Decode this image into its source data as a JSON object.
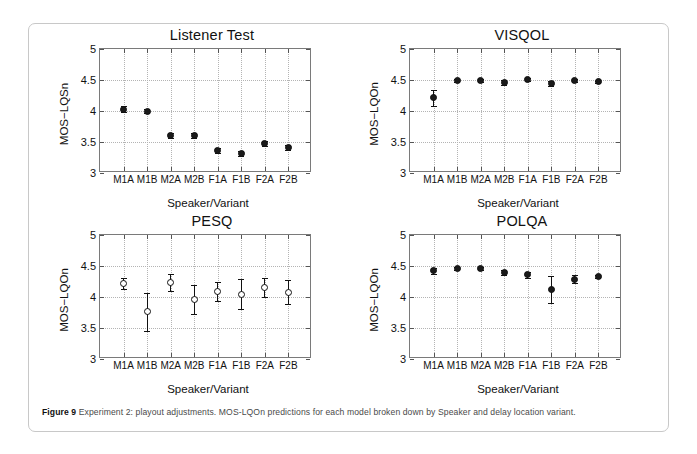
{
  "figure": {
    "caption_label": "Figure 9",
    "caption_text": "Experiment 2: playout adjustments. MOS-LQOn predictions for each model broken down by Speaker and delay location variant."
  },
  "chart_data": [
    {
      "type": "scatter",
      "title": "Listener Test",
      "xlabel": "Speaker/Variant",
      "ylabel": "MOS−LQSn",
      "categories": [
        "M1A",
        "M1B",
        "M2A",
        "M2B",
        "F1A",
        "F1B",
        "F2A",
        "F2B"
      ],
      "values": [
        4.03,
        4.0,
        3.61,
        3.61,
        3.36,
        3.32,
        3.48,
        3.41
      ],
      "err_low": [
        3.98,
        3.96,
        3.57,
        3.57,
        3.32,
        3.28,
        3.44,
        3.37
      ],
      "err_high": [
        4.08,
        4.04,
        3.65,
        3.65,
        3.4,
        3.36,
        3.52,
        3.45
      ],
      "marker_style": "filled",
      "ylim": [
        3,
        5
      ],
      "yticks": [
        "3",
        "3.5",
        "4",
        "4.5",
        "5"
      ],
      "ytick_values": [
        3,
        3.5,
        4,
        4.5,
        5
      ],
      "grid": true,
      "legend": "none"
    },
    {
      "type": "scatter",
      "title": "VISQOL",
      "xlabel": "Speaker/Variant",
      "ylabel": "MOS−LQOn",
      "categories": [
        "M1A",
        "M1B",
        "M2A",
        "M2B",
        "F1A",
        "F1B",
        "F2A",
        "F2B"
      ],
      "values": [
        4.21,
        4.49,
        4.49,
        4.46,
        4.51,
        4.45,
        4.49,
        4.47
      ],
      "err_low": [
        4.08,
        4.46,
        4.46,
        4.42,
        4.49,
        4.41,
        4.46,
        4.45
      ],
      "err_high": [
        4.34,
        4.52,
        4.52,
        4.5,
        4.53,
        4.49,
        4.52,
        4.49
      ],
      "marker_style": "filled",
      "ylim": [
        3,
        5
      ],
      "yticks": [
        "3",
        "3.5",
        "4",
        "4.5",
        "5"
      ],
      "ytick_values": [
        3,
        3.5,
        4,
        4.5,
        5
      ],
      "grid": true,
      "legend": "none"
    },
    {
      "type": "scatter",
      "title": "PESQ",
      "xlabel": "Speaker/Variant",
      "ylabel": "MOS−LQOn",
      "categories": [
        "M1A",
        "M1B",
        "M2A",
        "M2B",
        "F1A",
        "F1B",
        "F2A",
        "F2B"
      ],
      "values": [
        4.22,
        3.76,
        4.23,
        3.96,
        4.09,
        4.04,
        4.15,
        4.08
      ],
      "err_low": [
        4.13,
        3.45,
        4.09,
        3.73,
        3.93,
        3.8,
        4.0,
        3.89
      ],
      "err_high": [
        4.31,
        4.06,
        4.37,
        4.2,
        4.25,
        4.29,
        4.3,
        4.27
      ],
      "marker_style": "open",
      "ylim": [
        3,
        5
      ],
      "yticks": [
        "3",
        "3.5",
        "4",
        "4.5",
        "5"
      ],
      "ytick_values": [
        3,
        3.5,
        4,
        4.5,
        5
      ],
      "grid": true,
      "legend": "none"
    },
    {
      "type": "scatter",
      "title": "POLQA",
      "xlabel": "Speaker/Variant",
      "ylabel": "MOS−LQOn",
      "categories": [
        "M1A",
        "M1B",
        "M2A",
        "M2B",
        "F1A",
        "F1B",
        "F2A",
        "F2B"
      ],
      "values": [
        4.42,
        4.46,
        4.46,
        4.39,
        4.36,
        4.12,
        4.29,
        4.33
      ],
      "err_low": [
        4.37,
        4.44,
        4.44,
        4.36,
        4.31,
        3.9,
        4.23,
        4.31
      ],
      "err_high": [
        4.47,
        4.49,
        4.49,
        4.43,
        4.41,
        4.34,
        4.35,
        4.36
      ],
      "marker_style": "filled",
      "ylim": [
        3,
        5
      ],
      "yticks": [
        "3",
        "3.5",
        "4",
        "4.5",
        "5"
      ],
      "ytick_values": [
        3,
        3.5,
        4,
        4.5,
        5
      ],
      "grid": true,
      "legend": "none"
    }
  ]
}
